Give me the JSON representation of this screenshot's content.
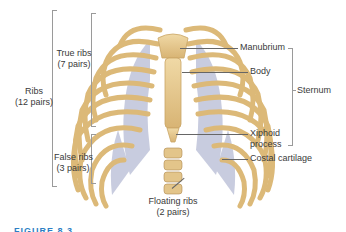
{
  "figure": {
    "type": "anatomical-diagram",
    "caption_partial": "FIGURE 8.3"
  },
  "labels_left": {
    "ribs": {
      "line1": "Ribs",
      "line2": "(12 pairs)"
    },
    "true_ribs": {
      "line1": "True ribs",
      "line2": "(7 pairs)"
    },
    "false_ribs": {
      "line1": "False ribs",
      "line2": "(3 pairs)"
    }
  },
  "labels_right": {
    "manubrium": "Manubrium",
    "body": "Body",
    "sternum": "Sternum",
    "xiphoid": {
      "line1": "Xiphoid",
      "line2": "process"
    },
    "costal_cartilage": "Costal cartilage"
  },
  "labels_bottom": {
    "floating_ribs": {
      "line1": "Floating ribs",
      "line2": "(2 pairs)"
    }
  },
  "colors": {
    "bone": "#e6c98f",
    "bone_dark": "#c9a465",
    "cartilage": "#b9bfd6",
    "leader_line": "#666666",
    "bracket": "#9a9a9a",
    "caption": "#2d7fc4"
  }
}
